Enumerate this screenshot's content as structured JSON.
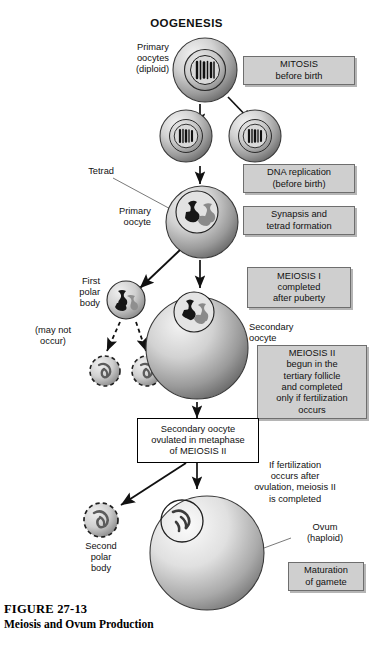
{
  "figure": {
    "title": "OOGENESIS",
    "caption_id": "FIGURE 27-13",
    "caption_title": "Meiosis and Ovum Production"
  },
  "labels": {
    "primary_oocytes": "Primary\noocytes\n(diploid)",
    "tetrad": "Tetrad",
    "primary_oocyte": "Primary\noocyte",
    "first_polar_body": "First\npolar\nbody",
    "may_not_occur": "(may not\noccur)",
    "secondary_oocyte": "Secondary\noocyte",
    "if_fertilization": "If fertilization\noccurs after\novulation, meiosis II\nis completed",
    "second_polar_body": "Second\npolar\nbody",
    "ovum": "Ovum\n(haploid)"
  },
  "callout_boxes": [
    {
      "id": "mitosis",
      "text": "MITOSIS\nbefore birth",
      "style": "gray"
    },
    {
      "id": "dna-replication",
      "text": "DNA replication\n(before birth)",
      "style": "gray"
    },
    {
      "id": "synapsis",
      "text": "Synapsis and\ntetrad formation",
      "style": "gray"
    },
    {
      "id": "meiosis-1",
      "text": "MEIOSIS I\ncompleted\nafter puberty",
      "style": "gray"
    },
    {
      "id": "meiosis-2",
      "text": "MEIOSIS II\nbegun in the\ntertiary follicle\nand completed\nonly if fertilization\noccurs",
      "style": "gray"
    },
    {
      "id": "ovulated",
      "text": "Secondary oocyte\novulated in metaphase\nof MEIOSIS II",
      "style": "white"
    },
    {
      "id": "maturation",
      "text": "Maturation\nof gamete",
      "style": "gray"
    }
  ],
  "colors": {
    "box_fill": "#cfcfcf",
    "box_border": "#6e6e6e",
    "cell_dark": "#6f6f6f",
    "cell_light": "#ededed",
    "outline": "#1a1a1a",
    "background": "#ffffff"
  },
  "cells": [
    {
      "id": "primary-oocyte-top",
      "label": "Primary oocytes (diploid)",
      "stage": "diploid",
      "cx": 205,
      "cy": 70,
      "r": 32
    },
    {
      "id": "daughter-cell-left",
      "label": "daughter cell after mitosis",
      "stage": "diploid",
      "cx": 186,
      "cy": 136,
      "r": 26
    },
    {
      "id": "daughter-cell-right",
      "label": "daughter cell after mitosis",
      "stage": "diploid",
      "cx": 255,
      "cy": 136,
      "r": 26
    },
    {
      "id": "primary-oocyte-tetrad",
      "label": "Primary oocyte",
      "stage": "tetrad",
      "cx": 202,
      "cy": 222,
      "r": 36
    },
    {
      "id": "first-polar-body",
      "label": "First polar body",
      "stage": "polar-body",
      "cx": 126,
      "cy": 300,
      "r": 19
    },
    {
      "id": "degenerate-polar-body-1",
      "label": "may not occur",
      "stage": "degenerating",
      "cx": 105,
      "cy": 371,
      "r": 15
    },
    {
      "id": "degenerate-polar-body-2",
      "label": "may not occur",
      "stage": "degenerating",
      "cx": 147,
      "cy": 371,
      "r": 15
    },
    {
      "id": "secondary-oocyte",
      "label": "Secondary oocyte",
      "stage": "haploid",
      "cx": 197,
      "cy": 348,
      "r": 51
    },
    {
      "id": "second-polar-body",
      "label": "Second polar body",
      "stage": "degenerating",
      "cx": 101,
      "cy": 520,
      "r": 17
    },
    {
      "id": "ovum",
      "label": "Ovum (haploid)",
      "stage": "haploid",
      "cx": 207,
      "cy": 553,
      "r": 57
    }
  ]
}
